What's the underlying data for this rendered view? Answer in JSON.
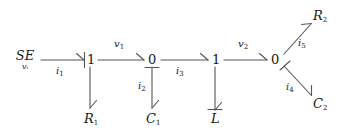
{
  "figure": {
    "type": "bond-graph",
    "background_color": "#ffffff",
    "stroke_color": "#555555",
    "text_color": "#1a1a1a",
    "width": 345,
    "height": 139
  },
  "nodes": {
    "source": {
      "symbol": "SE",
      "subscript": "v",
      "subsubscript": "i",
      "label": "SE",
      "sub_label": "vᵢ"
    },
    "junction_1a": {
      "label": "1"
    },
    "junction_0a": {
      "label": "0"
    },
    "junction_1b": {
      "label": "1"
    },
    "junction_0b": {
      "label": "0"
    },
    "r1": {
      "base": "R",
      "sub": "1"
    },
    "c1": {
      "base": "C",
      "sub": "1"
    },
    "l": {
      "base": "L",
      "sub": ""
    },
    "r2": {
      "base": "R",
      "sub": "2"
    },
    "c2": {
      "base": "C",
      "sub": "2"
    }
  },
  "bonds": [
    {
      "id": "b1",
      "label_base": "i",
      "label_sub": "1",
      "from": "source",
      "to": "junction_1a",
      "direction": "right"
    },
    {
      "id": "b2",
      "label_base": "v",
      "label_sub": "1",
      "from": "junction_1a",
      "to": "junction_0a",
      "direction": "right"
    },
    {
      "id": "b3",
      "label_base": "i",
      "label_sub": "3",
      "from": "junction_0a",
      "to": "junction_1b",
      "direction": "right"
    },
    {
      "id": "b4",
      "label_base": "v",
      "label_sub": "2",
      "from": "junction_1b",
      "to": "junction_0b",
      "direction": "right"
    },
    {
      "id": "b5",
      "label_base": "",
      "label_sub": "",
      "from": "junction_1a",
      "to": "r1",
      "direction": "down"
    },
    {
      "id": "b6",
      "label_base": "i",
      "label_sub": "2",
      "from": "junction_0a",
      "to": "c1",
      "direction": "down"
    },
    {
      "id": "b7",
      "label_base": "",
      "label_sub": "",
      "from": "junction_1b",
      "to": "l",
      "direction": "down"
    },
    {
      "id": "b8",
      "label_base": "i",
      "label_sub": "5",
      "from": "junction_0b",
      "to": "r2",
      "direction": "up-right"
    },
    {
      "id": "b9",
      "label_base": "i",
      "label_sub": "4",
      "from": "junction_0b",
      "to": "c2",
      "direction": "down-right"
    }
  ]
}
